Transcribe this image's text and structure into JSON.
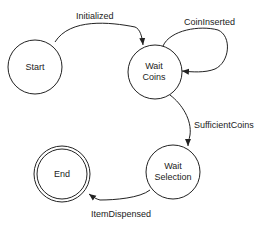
{
  "diagram": {
    "type": "state-machine",
    "nodes": [
      {
        "id": "start",
        "label_lines": [
          "Start"
        ],
        "cx": 35,
        "cy": 67,
        "r": 27,
        "final": false
      },
      {
        "id": "wait_coins",
        "label_lines": [
          "Wait",
          "Coins"
        ],
        "cx": 155,
        "cy": 72,
        "r": 27,
        "final": false
      },
      {
        "id": "wait_selection",
        "label_lines": [
          "Wait",
          "Selection"
        ],
        "cx": 173,
        "cy": 172,
        "r": 27,
        "final": false
      },
      {
        "id": "end",
        "label_lines": [
          "End"
        ],
        "cx": 62,
        "cy": 174,
        "r": 28,
        "final": true
      }
    ],
    "edges": [
      {
        "from": "start",
        "to": "wait_coins",
        "label": "Initialized"
      },
      {
        "from": "wait_coins",
        "to": "wait_coins",
        "label": "CoinInserted"
      },
      {
        "from": "wait_coins",
        "to": "wait_selection",
        "label": "SufficientCoins"
      },
      {
        "from": "wait_selection",
        "to": "end",
        "label": "ItemDispensed"
      }
    ]
  },
  "labels": {
    "start": "Start",
    "wait_coins_1": "Wait",
    "wait_coins_2": "Coins",
    "wait_selection_1": "Wait",
    "wait_selection_2": "Selection",
    "end": "End",
    "edge_initialized": "Initialized",
    "edge_coin_inserted": "CoinInserted",
    "edge_sufficient_coins": "SufficientCoins",
    "edge_item_dispensed": "ItemDispensed"
  },
  "colors": {
    "stroke": "#222222",
    "background": "#ffffff"
  }
}
